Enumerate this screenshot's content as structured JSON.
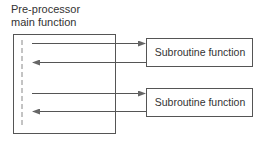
{
  "diagram": {
    "main": {
      "title_line1": "Pre-processor",
      "title_line2": "main function"
    },
    "subroutines": [
      {
        "label": "Subroutine function"
      },
      {
        "label": "Subroutine function"
      }
    ],
    "colors": {
      "stroke": "#555555",
      "text": "#333333",
      "dashed": "#777777"
    }
  }
}
